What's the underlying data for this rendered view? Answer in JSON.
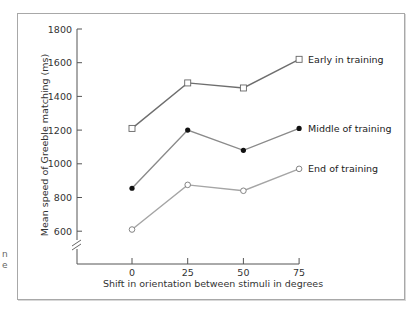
{
  "chart_data": {
    "type": "line",
    "title": "",
    "xlabel": "Shift in orientation between stimuli in degrees",
    "ylabel": "Mean speed of Greeble matching (ms)",
    "x": [
      0,
      25,
      50,
      75
    ],
    "x_ticks": [
      "0",
      "25",
      "50",
      "75"
    ],
    "y_ticks": [
      "600",
      "800",
      "1000",
      "1200",
      "1400",
      "1600",
      "1800"
    ],
    "ylim": [
      600,
      1800
    ],
    "y_axis_break": true,
    "grid": false,
    "legend_position": "inline-right",
    "series": [
      {
        "name": "Early in training",
        "marker": "open-square",
        "color": "#6e6e6e",
        "values": [
          1210,
          1480,
          1450,
          1620
        ]
      },
      {
        "name": "Middle of training",
        "marker": "filled-circle",
        "color": "#8a8a8a",
        "values": [
          855,
          1200,
          1080,
          1210
        ]
      },
      {
        "name": "End of training",
        "marker": "open-circle",
        "color": "#a5a5a5",
        "values": [
          610,
          875,
          840,
          970
        ]
      }
    ]
  },
  "edge_fragments": [
    "n",
    "e"
  ]
}
